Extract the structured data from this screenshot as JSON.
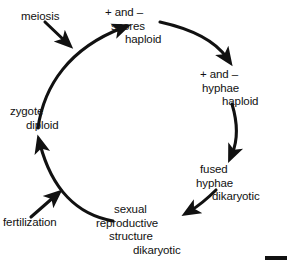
{
  "diagram": {
    "type": "cycle-diagram",
    "background_color": "#ffffff",
    "ink_color": "#111111",
    "stages": [
      {
        "id": "spores",
        "position": "top",
        "lines": [
          "+ and –",
          "spores",
          "haploid"
        ]
      },
      {
        "id": "hyphae",
        "position": "right",
        "lines": [
          "+ and –",
          "hyphae",
          "haploid"
        ]
      },
      {
        "id": "fused-hyphae",
        "position": "lower-right",
        "lines": [
          "fused",
          "hyphae",
          "dikaryotic"
        ]
      },
      {
        "id": "sexual-reproductive-structure",
        "position": "bottom",
        "lines": [
          "sexual",
          "reproductive",
          "structure",
          "dikaryotic"
        ]
      },
      {
        "id": "zygote",
        "position": "left",
        "lines": [
          "zygote",
          "diploid"
        ]
      }
    ],
    "processes": [
      {
        "id": "meiosis",
        "label": "meiosis",
        "position": "top-left"
      },
      {
        "id": "fertilization",
        "label": "fertilization",
        "position": "bottom-left"
      }
    ],
    "scale_bar": {
      "id": "scale-bar",
      "label": "",
      "position": "bottom-right"
    }
  }
}
